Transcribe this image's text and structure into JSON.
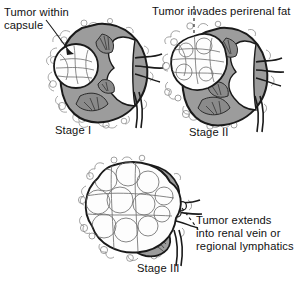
{
  "figure": {
    "background_color": "#ffffff",
    "ink_color": "#1a1a1a",
    "parenchyma_color": "#9a9a9a",
    "medulla_color": "#8a8a8a",
    "tumor_color": "#fdfdfd"
  },
  "panels": [
    {
      "id": "stage-1",
      "caption": "Stage I",
      "annotation": "Tumor within\ncapsule",
      "annotation_leader": "solid-line",
      "tumor_size": "small",
      "tumor_location": "upper-anterior-cortex"
    },
    {
      "id": "stage-2",
      "caption": "Stage II",
      "annotation": "Tumor invades perirenal fat",
      "annotation_leader": "dashed-line",
      "tumor_size": "medium",
      "tumor_location": "upper-pole-extending-beyond-capsule"
    },
    {
      "id": "stage-3",
      "caption": "Stage III",
      "annotation": "Tumor extends\ninto renal vein or\nregional lymphatics",
      "annotation_leader": "dashed-line",
      "tumor_size": "large",
      "tumor_location": "replacing-most-of-kidney"
    }
  ]
}
